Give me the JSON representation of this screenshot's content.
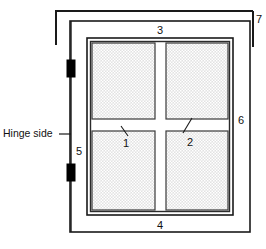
{
  "diagram": {
    "hinge_label": "Hinge side",
    "callouts": {
      "pane_muntin_horizontal": "1",
      "pane_muntin_vertical": "2",
      "header_top": "3",
      "sill_bottom": "4",
      "jamb_left": "5",
      "jamb_right": "6",
      "outer_bracket": "7"
    },
    "colors": {
      "line": "#1a1a1a",
      "frame_dark": "#2b2b2b",
      "glass_fill": "#d8d8d8",
      "glass_stipple": "#ffffff",
      "hinge_fill": "#000000",
      "background": "#ffffff"
    },
    "parts": {
      "glass_panes_count": "4",
      "hinges_count": "2"
    }
  }
}
